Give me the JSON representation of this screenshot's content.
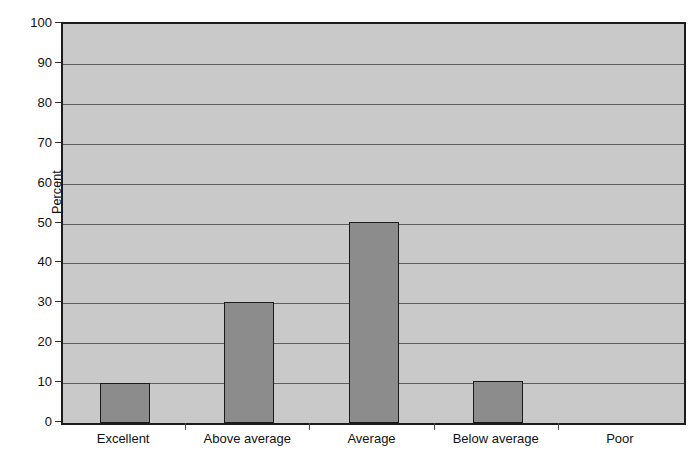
{
  "chart_data": {
    "type": "bar",
    "title": "",
    "subtitle": "",
    "categories": [
      "Excellent",
      "Above average",
      "Average",
      "Below average",
      "Poor"
    ],
    "values": [
      10.0,
      30.3,
      50.3,
      10.5,
      0
    ],
    "xlabel": "",
    "ylabel": "Percent",
    "ylim": [
      0,
      100
    ],
    "ytick_labels": [
      "0",
      "10",
      "20",
      "30",
      "40",
      "50",
      "60",
      "70",
      "80",
      "90",
      "100"
    ],
    "ytick_values": [
      0,
      10,
      20,
      30,
      40,
      50,
      60,
      70,
      80,
      90,
      100
    ],
    "grid": true,
    "legend": false,
    "legend_position": "none",
    "colors": {
      "bar_fill": "#8c8c8c",
      "bar_border": "#1a1a1a",
      "plot_background": "#c9c9c9",
      "gridline": "#5d5d5d",
      "axis": "#1c1c1c",
      "text": "#111111",
      "page_background": "#ffffff"
    }
  }
}
